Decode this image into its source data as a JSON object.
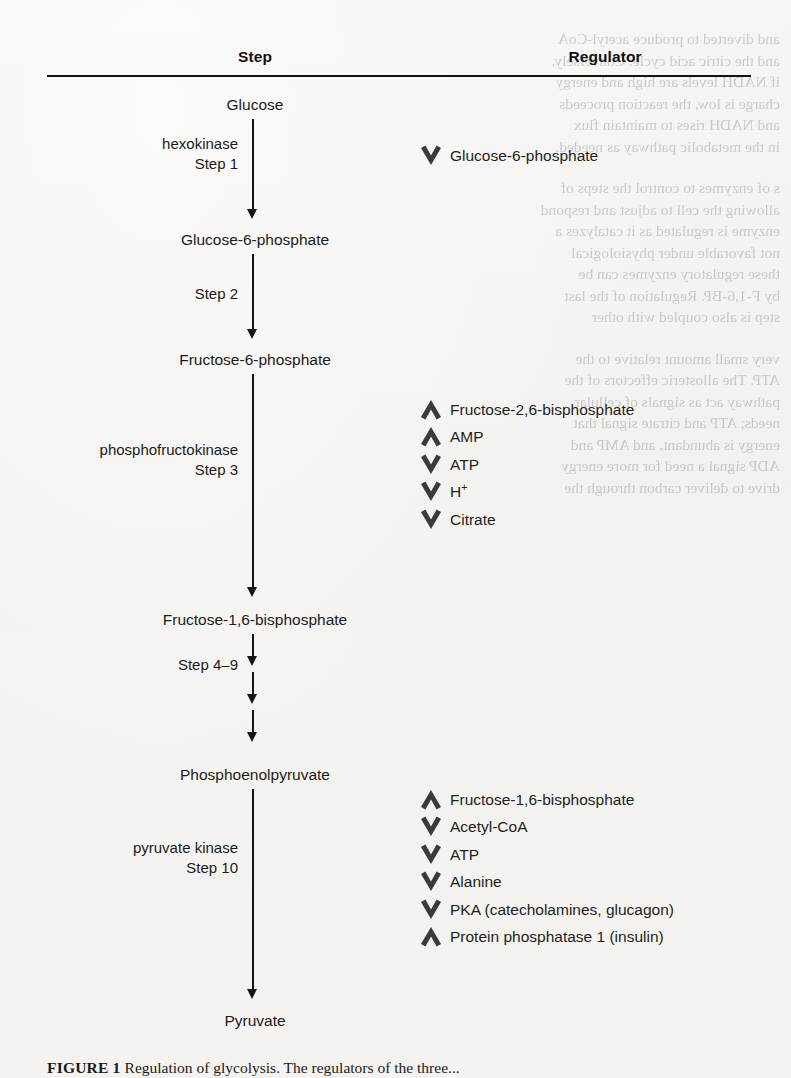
{
  "figure": {
    "headers": {
      "step": "Step",
      "regulator": "Regulator"
    },
    "caption_label": "FIGURE 1 ",
    "caption_text": "Regulation of glycolysis. The regulators of the three..."
  },
  "pathway": {
    "metabolites": [
      {
        "name": "Glucose",
        "y": 96,
        "left": 130,
        "width": 250
      },
      {
        "name": "Glucose-6-phosphate",
        "y": 231,
        "left": 130,
        "width": 250
      },
      {
        "name": "Fructose-6-phosphate",
        "y": 351,
        "left": 130,
        "width": 250
      },
      {
        "name": "Fructose-1,6-bisphosphate",
        "y": 611,
        "left": 110,
        "width": 290
      },
      {
        "name": "Phosphoenolpyruvate",
        "y": 766,
        "left": 130,
        "width": 250
      },
      {
        "name": "Pyruvate",
        "y": 1012,
        "left": 130,
        "width": 250
      }
    ],
    "enzymes": [
      {
        "lines": [
          "hexokinase",
          "Step 1"
        ],
        "y": 134,
        "right_edge": 238
      },
      {
        "lines": [
          "Step 2"
        ],
        "y": 284,
        "right_edge": 238
      },
      {
        "lines": [
          "phosphofructokinase",
          "Step 3"
        ],
        "y": 440,
        "right_edge": 238
      },
      {
        "lines": [
          "Step 4–9"
        ],
        "y": 655,
        "right_edge": 238
      },
      {
        "lines": [
          "pyruvate kinase",
          "Step 10"
        ],
        "y": 838,
        "right_edge": 238
      }
    ],
    "arrows": [
      {
        "x": 245,
        "y": 119,
        "length": 100
      },
      {
        "x": 245,
        "y": 254,
        "length": 85
      },
      {
        "x": 245,
        "y": 374,
        "length": 223
      },
      {
        "x": 245,
        "y": 634,
        "length": 32
      },
      {
        "x": 245,
        "y": 672,
        "length": 32
      },
      {
        "x": 245,
        "y": 710,
        "length": 32
      },
      {
        "x": 245,
        "y": 789,
        "length": 210
      }
    ]
  },
  "regulators": {
    "groups": [
      {
        "name": "hexokinase-regulators",
        "top": 142,
        "left": 419,
        "rows": [
          {
            "direction": "down",
            "label": "Glucose-6-phosphate",
            "html": "Glucose-6-phosphate"
          }
        ]
      },
      {
        "name": "phosphofructokinase-regulators",
        "top": 396,
        "left": 419,
        "rows": [
          {
            "direction": "up",
            "label": "Fructose-2,6-bisphosphate",
            "html": "Fructose-2,6-bisphosphate"
          },
          {
            "direction": "up",
            "label": "AMP",
            "html": "AMP"
          },
          {
            "direction": "down",
            "label": "ATP",
            "html": "ATP"
          },
          {
            "direction": "down",
            "label": "H+",
            "html": "H<sup>+</sup>"
          },
          {
            "direction": "down",
            "label": "Citrate",
            "html": "Citrate"
          }
        ]
      },
      {
        "name": "pyruvate-kinase-regulators",
        "top": 786,
        "left": 419,
        "rows": [
          {
            "direction": "up",
            "label": "Fructose-1,6-bisphosphate",
            "html": "Fructose-1,6-bisphosphate"
          },
          {
            "direction": "down",
            "label": "Acetyl-CoA",
            "html": "Acetyl-CoA"
          },
          {
            "direction": "down",
            "label": "ATP",
            "html": "ATP"
          },
          {
            "direction": "down",
            "label": "Alanine",
            "html": "Alanine"
          },
          {
            "direction": "down",
            "label": "PKA (catecholamines, glucagon)",
            "html": "PKA (catecholamines, glucagon)"
          },
          {
            "direction": "up",
            "label": "Protein phosphatase 1 (insulin)",
            "html": "Protein phosphatase 1 (insulin)"
          }
        ]
      }
    ],
    "row_spacing": 27.5,
    "chevron_color": "#3a3a3a"
  },
  "ghost_text": {
    "blocks": [
      "and diverted to produce acetyl-CoA\nand the citric acid cycle. Conversely,\nif NADH levels are high and energy\ncharge is low, the reaction proceeds\nand NADH rises to maintain flux\nin the metabolic pathway as needed.",
      "s of enzymes to control the steps of\nallowing the cell to adjust and respond\nenzyme is regulated as it catalyzes a\nnot favorable under physiological\nthese regulatory enzymes can be\nby F-1,6-BP. Regulation of the last\nstep is also coupled with other",
      "very small amount relative to the\nATP. The allosteric effectors of the\npathway act as signals of cellular\nneeds; ATP and citrate signal that\nenergy is abundant, and AMP and\nADP signal a need for more energy\ndrive to deliver carbon through the"
    ]
  },
  "colors": {
    "ink": "#1b1b1b",
    "rule": "#121212",
    "chevron": "#3a3a3a",
    "paper": "#f4f3f1"
  }
}
